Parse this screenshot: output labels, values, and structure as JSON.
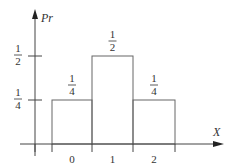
{
  "chart_data": {
    "type": "bar",
    "title": "",
    "xlabel": "X",
    "ylabel": "Pr",
    "categories": [
      "0",
      "1",
      "2"
    ],
    "values": [
      0.25,
      0.5,
      0.25
    ],
    "value_labels": [
      {
        "num": "1",
        "den": "4"
      },
      {
        "num": "1",
        "den": "2"
      },
      {
        "num": "1",
        "den": "4"
      }
    ],
    "y_ticks": [
      {
        "value": 0.25,
        "num": "1",
        "den": "4"
      },
      {
        "value": 0.5,
        "num": "1",
        "den": "2"
      }
    ],
    "ylim": [
      0,
      0.6
    ],
    "grid": false,
    "legend": null,
    "bar_style": "outline, adjacent (histogram)"
  },
  "colors": {
    "axis": "#444444",
    "bar_stroke": "#666666",
    "text": "#333333"
  }
}
